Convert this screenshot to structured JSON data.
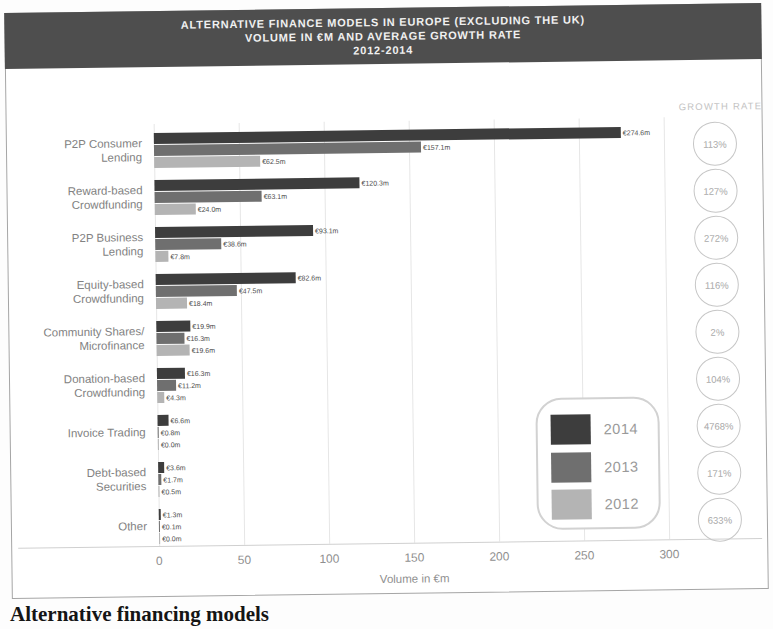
{
  "figure": {
    "title_lines": [
      "ALTERNATIVE FINANCE MODELS IN EUROPE (EXCLUDING THE UK)",
      "VOLUME IN €M AND AVERAGE GROWTH RATE",
      "2012-2014"
    ],
    "growth_rate_header": "GROWTH RATE",
    "caption": "Alternative financing models"
  },
  "chart_data": {
    "type": "bar",
    "orientation": "horizontal",
    "title": "Alternative Finance Models in Europe (Excluding the UK) Volume in €M and Average Growth Rate 2012-2014",
    "xlabel": "Volume in €m",
    "ylabel": "",
    "xlim": [
      0,
      300
    ],
    "xticks": [
      0,
      50,
      100,
      150,
      200,
      250,
      300
    ],
    "grid": true,
    "legend_position": "lower-right",
    "legend": [
      {
        "name": "2014",
        "color": "#3d3d3d"
      },
      {
        "name": "2013",
        "color": "#6f6f6f"
      },
      {
        "name": "2012",
        "color": "#b4b4b4"
      }
    ],
    "categories": [
      "P2P Consumer Lending",
      "Reward-based Crowdfunding",
      "P2P Business Lending",
      "Equity-based Crowdfunding",
      "Community Shares/Microfinance",
      "Donation-based Crowdfunding",
      "Invoice Trading",
      "Debt-based Securities",
      "Other"
    ],
    "rows": [
      {
        "label_lines": [
          "P2P Consumer",
          "Lending"
        ],
        "values": [
          274.6,
          157.1,
          62.5
        ],
        "value_labels": [
          "€274.6m",
          "€157.1m",
          "€62.5m"
        ],
        "growth_rate": "113%"
      },
      {
        "label_lines": [
          "Reward-based",
          "Crowdfunding"
        ],
        "values": [
          120.3,
          63.1,
          24.0
        ],
        "value_labels": [
          "€120.3m",
          "€63.1m",
          "€24.0m"
        ],
        "growth_rate": "127%"
      },
      {
        "label_lines": [
          "P2P Business",
          "Lending"
        ],
        "values": [
          93.1,
          38.6,
          7.8
        ],
        "value_labels": [
          "€93.1m",
          "€38.6m",
          "€7.8m"
        ],
        "growth_rate": "272%"
      },
      {
        "label_lines": [
          "Equity-based",
          "Crowdfunding"
        ],
        "values": [
          82.6,
          47.5,
          18.4
        ],
        "value_labels": [
          "€82.6m",
          "€47.5m",
          "€18.4m"
        ],
        "growth_rate": "116%"
      },
      {
        "label_lines": [
          "Community Shares/",
          "Microfinance"
        ],
        "values": [
          19.9,
          16.3,
          19.6
        ],
        "value_labels": [
          "€19.9m",
          "€16.3m",
          "€19.6m"
        ],
        "growth_rate": "2%"
      },
      {
        "label_lines": [
          "Donation-based",
          "Crowdfunding"
        ],
        "values": [
          16.3,
          11.2,
          4.3
        ],
        "value_labels": [
          "€16.3m",
          "€11.2m",
          "€4.3m"
        ],
        "growth_rate": "104%"
      },
      {
        "label_lines": [
          "Invoice Trading"
        ],
        "values": [
          6.6,
          0.8,
          0.0
        ],
        "value_labels": [
          "€6.6m",
          "€0.8m",
          "€0.0m"
        ],
        "growth_rate": "4768%"
      },
      {
        "label_lines": [
          "Debt-based",
          "Securities"
        ],
        "values": [
          3.6,
          1.7,
          0.5
        ],
        "value_labels": [
          "€3.6m",
          "€1.7m",
          "€0.5m"
        ],
        "growth_rate": "171%"
      },
      {
        "label_lines": [
          "Other"
        ],
        "values": [
          1.3,
          0.1,
          0.0
        ],
        "value_labels": [
          "€1.3m",
          "€0.1m",
          "€0.0m"
        ],
        "growth_rate": "633%"
      }
    ]
  }
}
